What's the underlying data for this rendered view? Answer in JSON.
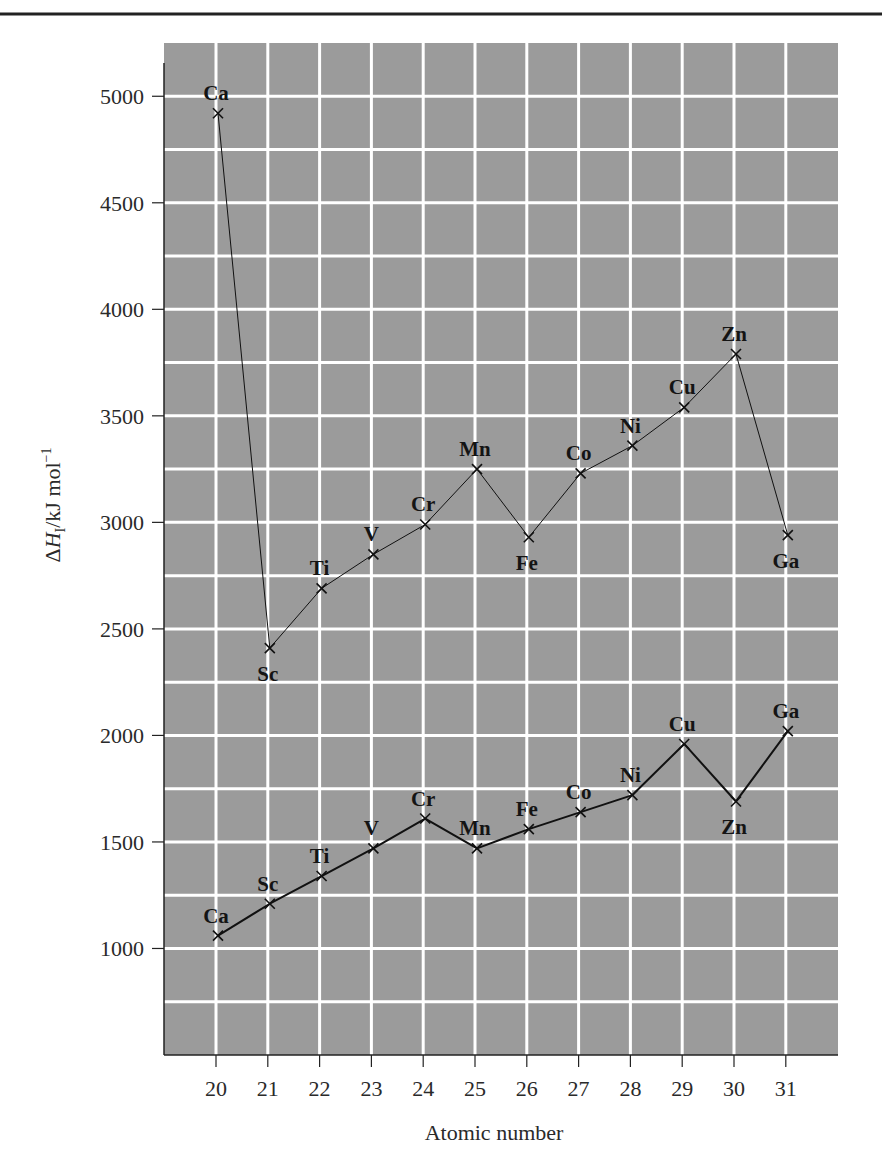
{
  "chart_data": {
    "type": "line",
    "title": "",
    "xlabel": "Atomic number",
    "ylabel": "ΔH_I/kJ mol⁻¹",
    "ylabel_parts": {
      "delta": "Δ",
      "H": "H",
      "sub": "I",
      "unit": "/kJ mol",
      "sup": "−1"
    },
    "x": [
      20,
      21,
      22,
      23,
      24,
      25,
      26,
      27,
      28,
      29,
      30,
      31
    ],
    "x_tick_labels": [
      "20",
      "21",
      "22",
      "23",
      "24",
      "25",
      "26",
      "27",
      "28",
      "29",
      "30",
      "31"
    ],
    "y_tick_labels": [
      "1000",
      "1500",
      "2000",
      "2500",
      "3000",
      "3500",
      "4000",
      "4500",
      "5000"
    ],
    "y_ticks": [
      1000,
      1500,
      2000,
      2500,
      3000,
      3500,
      4000,
      4500,
      5000
    ],
    "ylim": [
      500,
      5250
    ],
    "xlim": [
      19,
      32
    ],
    "grid": true,
    "grid_y_step": 250,
    "grid_x_step": 1,
    "legend": "none",
    "series": [
      {
        "name": "upper",
        "line_width": 1,
        "elements": [
          "Ca",
          "Sc",
          "Ti",
          "V",
          "Cr",
          "Mn",
          "Fe",
          "Co",
          "Ni",
          "Cu",
          "Zn",
          "Ga"
        ],
        "values": [
          4920,
          2410,
          2690,
          2850,
          2990,
          3250,
          2930,
          3230,
          3360,
          3540,
          3790,
          2940
        ],
        "label_position": [
          "above",
          "below",
          "above",
          "above",
          "above",
          "above",
          "below",
          "above",
          "above",
          "above",
          "above",
          "below"
        ]
      },
      {
        "name": "lower",
        "line_width": 2,
        "elements": [
          "Ca",
          "Sc",
          "Ti",
          "V",
          "Cr",
          "Mn",
          "Fe",
          "Co",
          "Ni",
          "Cu",
          "Zn",
          "Ga"
        ],
        "values": [
          1060,
          1210,
          1340,
          1470,
          1610,
          1470,
          1560,
          1640,
          1720,
          1960,
          1690,
          2020
        ],
        "label_position": [
          "above",
          "above",
          "above",
          "above",
          "above",
          "above",
          "above",
          "above",
          "above",
          "above",
          "below",
          "above"
        ]
      }
    ]
  },
  "colors": {
    "plot_background": "#9b9b9b",
    "grid": "#ffffff",
    "series_line": "#111111",
    "text": "#2a2a2a",
    "rule": "#222222"
  }
}
